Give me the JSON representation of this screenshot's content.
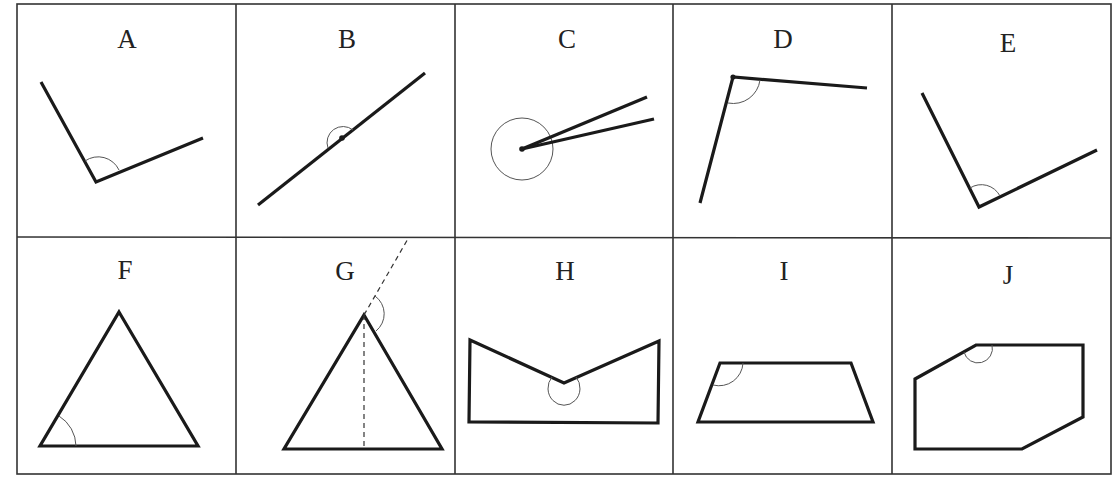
{
  "diagram": {
    "grid": {
      "rows": 2,
      "columns": 5
    },
    "cells": [
      {
        "label": "A",
        "description": "Obtuse angle between two rays, angle arc at vertex"
      },
      {
        "label": "B",
        "description": "Straight angle: single line through a marked point with arc"
      },
      {
        "label": "C",
        "description": "Reflex angle: two rays with near-full circle arc at vertex"
      },
      {
        "label": "D",
        "description": "Acute-ish angle opening downward-right, arc at top vertex"
      },
      {
        "label": "E",
        "description": "Obtuse angle between two rays, arc at vertex"
      },
      {
        "label": "F",
        "description": "Triangle with interior base angle marked"
      },
      {
        "label": "G",
        "description": "Triangle with exterior angle at apex (dashed extension) and dashed altitude"
      },
      {
        "label": "H",
        "description": "Concave pentagon with reflex angle marked at notch"
      },
      {
        "label": "I",
        "description": "Trapezoid with obtuse top-left interior angle marked"
      },
      {
        "label": "J",
        "description": "Hexagon with obtuse interior angle marked at top-left vertex"
      }
    ]
  }
}
